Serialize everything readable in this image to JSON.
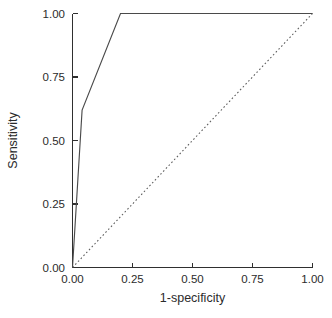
{
  "chart_data": {
    "type": "line",
    "title": "",
    "subtitle": "",
    "xlabel": "1-specificity",
    "ylabel": "Sensitivity",
    "xlim": [
      0.0,
      1.0
    ],
    "ylim": [
      0.0,
      1.0
    ],
    "xticks": [
      0.0,
      0.25,
      0.5,
      0.75,
      1.0
    ],
    "yticks": [
      0.0,
      0.25,
      0.5,
      0.75,
      1.0
    ],
    "xtick_labels": [
      "0.00",
      "0.25",
      "0.50",
      "0.75",
      "1.00"
    ],
    "ytick_labels": [
      "0.00",
      "0.25",
      "0.50",
      "0.75",
      "1.00"
    ],
    "grid": false,
    "legend": false,
    "legend_position": "none",
    "tick_direction": "in",
    "spines": [
      "left",
      "bottom"
    ],
    "series": [
      {
        "name": "ROC curve",
        "style": "solid",
        "color": "#4a4a4a",
        "x": [
          0.0,
          0.04,
          0.2,
          1.0
        ],
        "y": [
          0.0,
          0.62,
          1.0,
          1.0
        ]
      },
      {
        "name": "Reference line",
        "style": "dotted",
        "color": "#5a5a5a",
        "x": [
          0.0,
          1.0
        ],
        "y": [
          0.0,
          1.0
        ]
      }
    ]
  },
  "axes": {
    "x_title": "1-specificity",
    "y_title": "Sensitivity",
    "x_tick_labels": [
      "0.00",
      "0.25",
      "0.50",
      "0.75",
      "1.00"
    ],
    "y_tick_labels": [
      "0.00",
      "0.25",
      "0.50",
      "0.75",
      "1.00"
    ]
  },
  "colors": {
    "background": "#ffffff",
    "axis": "#2f2f2f",
    "roc_curve": "#4a4a4a",
    "reference_line": "#5a5a5a",
    "text": "#2b2b2b"
  }
}
